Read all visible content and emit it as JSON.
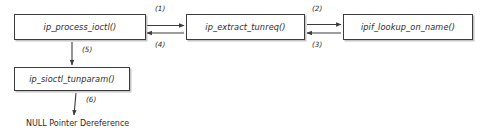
{
  "diagram": {
    "type": "call-flow",
    "background_color": "#ffffff",
    "stroke_color": "#3c3c3c",
    "text_color": "#2b2b2b",
    "nodes": [
      {
        "id": "ip_process_ioctl",
        "label": "ip_process_ioctl()"
      },
      {
        "id": "ip_extract_tunreq",
        "label": "ip_extract_tunreq()"
      },
      {
        "id": "ipif_lookup_on_name",
        "label": "ipif_lookup_on_name()"
      },
      {
        "id": "ip_sioctl_tunparam",
        "label": "ip_sioctl_tunparam()"
      }
    ],
    "edges": [
      {
        "id": "e1",
        "label": "(1)",
        "from": "ip_process_ioctl",
        "to": "ip_extract_tunreq",
        "direction": "right"
      },
      {
        "id": "e4",
        "label": "(4)",
        "from": "ip_extract_tunreq",
        "to": "ip_process_ioctl",
        "direction": "left"
      },
      {
        "id": "e2",
        "label": "(2)",
        "from": "ip_extract_tunreq",
        "to": "ipif_lookup_on_name",
        "direction": "right"
      },
      {
        "id": "e3",
        "label": "(3)",
        "from": "ipif_lookup_on_name",
        "to": "ip_extract_tunreq",
        "direction": "left"
      },
      {
        "id": "e5",
        "label": "(5)",
        "from": "ip_process_ioctl",
        "to": "ip_sioctl_tunparam",
        "direction": "down"
      },
      {
        "id": "e6",
        "label": "(6)",
        "from": "ip_sioctl_tunparam",
        "to": "null_pointer_deref",
        "direction": "down"
      }
    ],
    "terminal": {
      "id": "null_pointer_deref",
      "label": "NULL Pointer Dereference"
    }
  }
}
